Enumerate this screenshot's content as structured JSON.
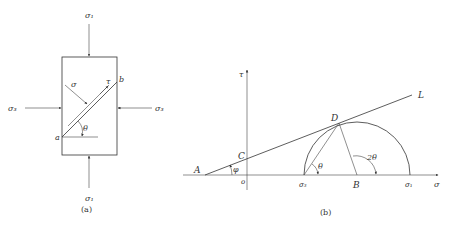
{
  "panel_a": {
    "caption": "(a)",
    "labels": {
      "sigma1_top": "σ₁",
      "sigma1_bottom": "σ₁",
      "sigma3_left": "σ₃",
      "sigma3_right": "σ₃",
      "sigma": "σ",
      "tau": "τ",
      "a": "a",
      "b": "b",
      "theta": "θ"
    }
  },
  "panel_b": {
    "caption": "(b)",
    "labels": {
      "tau_axis": "τ",
      "sigma_axis": "σ",
      "origin": "o",
      "A": "A",
      "C": "C",
      "D": "D",
      "B": "B",
      "L": "L",
      "phi": "φ",
      "theta": "θ",
      "two_theta": "2θ",
      "sigma3": "σ₃",
      "sigma1": "σ₁"
    }
  }
}
